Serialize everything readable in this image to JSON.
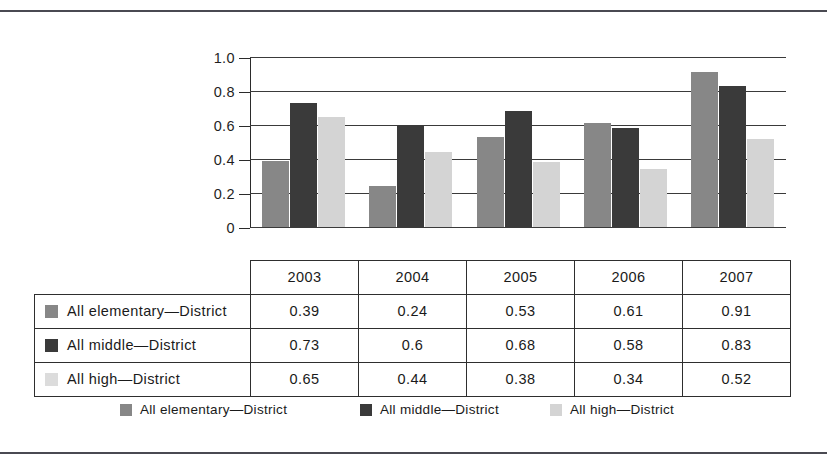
{
  "chart_data": {
    "type": "bar",
    "title": "",
    "subtitle": "",
    "xlabel": "",
    "ylabel": "",
    "categories": [
      "2003",
      "2004",
      "2005",
      "2006",
      "2007"
    ],
    "series": [
      {
        "name": "All elementary—District",
        "color": "#878787",
        "values": [
          0.39,
          0.24,
          0.53,
          0.61,
          0.91
        ]
      },
      {
        "name": "All middle—District",
        "color": "#3a3a3a",
        "values": [
          0.73,
          0.6,
          0.68,
          0.58,
          0.83
        ]
      },
      {
        "name": "All high—District",
        "color": "#d4d4d4",
        "values": [
          0.65,
          0.44,
          0.38,
          0.34,
          0.52
        ]
      }
    ],
    "ylim": [
      0,
      1.0
    ],
    "ytick_labels": [
      "1.0",
      "0.8",
      "0.6",
      "0.4",
      "0.2",
      "0"
    ],
    "ytick_values": [
      1.0,
      0.8,
      0.6,
      0.4,
      0.2,
      0
    ],
    "grid": "horizontal",
    "legend_position": "bottom"
  },
  "table": {
    "corner_label": "",
    "column_headers": [
      "2003",
      "2004",
      "2005",
      "2006",
      "2007"
    ],
    "rows": [
      {
        "label": "All elementary—District",
        "swatch": "#878787",
        "cells": [
          "0.39",
          "0.24",
          "0.53",
          "0.61",
          "0.91"
        ]
      },
      {
        "label": "All middle—District",
        "swatch": "#3a3a3a",
        "cells": [
          "0.73",
          "0.6",
          "0.68",
          "0.58",
          "0.83"
        ]
      },
      {
        "label": "All high—District",
        "swatch": "#dcdcdc",
        "cells": [
          "0.65",
          "0.44",
          "0.38",
          "0.34",
          "0.52"
        ]
      }
    ]
  },
  "legend": {
    "items": [
      {
        "label": "All elementary—District",
        "color": "#878787"
      },
      {
        "label": "All middle—District",
        "color": "#3a3a3a"
      },
      {
        "label": "All high—District",
        "color": "#d4d4d4"
      }
    ]
  },
  "colors": {
    "series_elementary": "#878787",
    "series_middle": "#3a3a3a",
    "series_high": "#d4d4d4",
    "axis": "#2b2b2b",
    "grid": "#3a3a3a",
    "rule": "#4a4a52"
  }
}
